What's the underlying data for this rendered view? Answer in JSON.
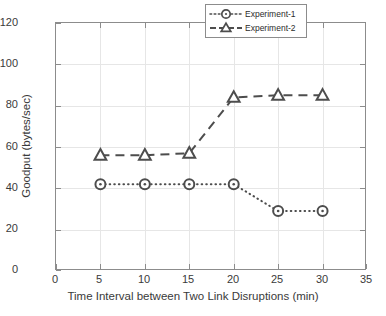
{
  "chart_data": {
    "type": "line",
    "title": "",
    "xlabel": "Time Interval between Two Link Disruptions (min)",
    "ylabel": "Goodput (bytes/sec)",
    "x": [
      5,
      10,
      15,
      20,
      25,
      30
    ],
    "xlim": [
      0,
      35
    ],
    "ylim": [
      0,
      120
    ],
    "xticks": [
      0,
      5,
      10,
      15,
      20,
      25,
      30,
      35
    ],
    "yticks": [
      0,
      20,
      40,
      60,
      80,
      100,
      120
    ],
    "grid": true,
    "legend_position": "top-right",
    "series": [
      {
        "name": "Experiment-1",
        "values": [
          42,
          42,
          42,
          42,
          29,
          29
        ],
        "marker": "circle",
        "linestyle": "dotted",
        "color": "#4d4d4d"
      },
      {
        "name": "Experiment-2",
        "values": [
          56,
          56,
          57,
          84,
          85,
          85
        ],
        "marker": "triangle",
        "linestyle": "dashed",
        "color": "#4d4d4d"
      }
    ]
  },
  "legend": {
    "items": [
      {
        "label": "Experiment-1"
      },
      {
        "label": "Experiment-2"
      }
    ]
  },
  "colors": {
    "axis": "#8c8c8c",
    "grid": "#e6e6e6",
    "series": "#4d4d4d",
    "text": "#3a3a3a",
    "background": "#ffffff"
  }
}
